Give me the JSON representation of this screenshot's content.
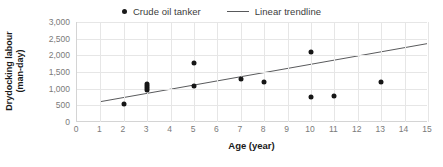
{
  "chart_data": {
    "type": "scatter",
    "title": "",
    "xlabel": "Age (year)",
    "ylabel_line1": "Drydocking labour",
    "ylabel_line2": "(man-day)",
    "xlim": [
      0,
      15
    ],
    "ylim": [
      0,
      3000
    ],
    "x_ticks": [
      0,
      1,
      2,
      3,
      4,
      5,
      6,
      7,
      8,
      9,
      10,
      11,
      12,
      13,
      14,
      15
    ],
    "x_tick_labels": [
      "0",
      "1",
      "2",
      "3",
      "4",
      "5",
      "6",
      "7",
      "8",
      "9",
      "10",
      "11",
      "12",
      "13",
      "14",
      "15"
    ],
    "y_ticks": [
      0,
      500,
      1000,
      1500,
      2000,
      2500,
      3000
    ],
    "y_tick_labels": [
      "0",
      "500",
      "1,000",
      "1,500",
      "2,000",
      "2,500",
      "3,000"
    ],
    "grid": true,
    "legend_position": "top-center",
    "series": [
      {
        "name": "Crude oil tanker",
        "type": "scatter",
        "marker": "circle",
        "color": "#161616",
        "points": [
          {
            "x": 2,
            "y": 540
          },
          {
            "x": 3,
            "y": 950
          },
          {
            "x": 3,
            "y": 1020
          },
          {
            "x": 3,
            "y": 1080
          },
          {
            "x": 3,
            "y": 1150
          },
          {
            "x": 5,
            "y": 1780
          },
          {
            "x": 5,
            "y": 1090
          },
          {
            "x": 7,
            "y": 1280
          },
          {
            "x": 8,
            "y": 1200
          },
          {
            "x": 10,
            "y": 2100
          },
          {
            "x": 10,
            "y": 750
          },
          {
            "x": 11,
            "y": 770
          },
          {
            "x": 13,
            "y": 1200
          }
        ]
      },
      {
        "name": "Linear trendline",
        "type": "line",
        "color": "#58595b",
        "endpoints": [
          {
            "x": 1,
            "y": 610
          },
          {
            "x": 15,
            "y": 2350
          }
        ]
      }
    ]
  },
  "legend": {
    "items": [
      {
        "label": "Crude oil tanker",
        "marker": "dot-marker-icon"
      },
      {
        "label": "Linear trendline",
        "marker": "line-marker-icon"
      }
    ]
  }
}
